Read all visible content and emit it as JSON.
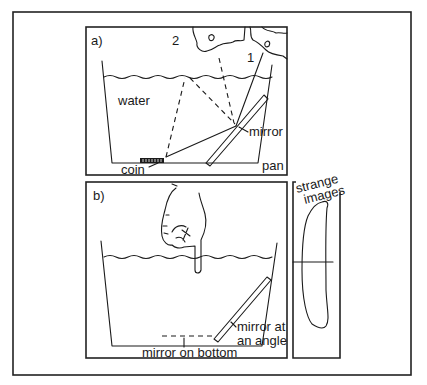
{
  "figure": {
    "panel_a": {
      "label": "a)",
      "labels": {
        "water": "water",
        "mirror": "mirror",
        "coin": "coin",
        "pan": "pan",
        "viewpoint_1": "1",
        "viewpoint_2": "2"
      }
    },
    "panel_b": {
      "label": "b)",
      "labels": {
        "mirror_angle_line1": "mirror at",
        "mirror_angle_line2": "an angle",
        "mirror_bottom": "mirror on bottom"
      }
    },
    "panel_strange": {
      "title_line1": "strange",
      "title_line2": "images"
    },
    "colors": {
      "ink": "#1a1a1a",
      "background": "#ffffff"
    }
  }
}
